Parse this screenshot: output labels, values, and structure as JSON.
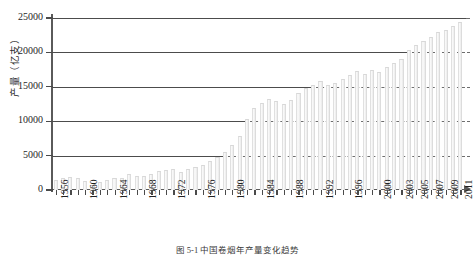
{
  "chart_data": {
    "type": "bar",
    "title": "",
    "xlabel": "",
    "ylabel": "产量（亿支）",
    "ylim": [
      0,
      25000
    ],
    "yticks": [
      0,
      5000,
      10000,
      15000,
      20000,
      25000
    ],
    "ytick_labels": [
      "0",
      "5000",
      "10000",
      "15000",
      "20000",
      "25000"
    ],
    "grid": true,
    "legend": "none",
    "categories": [
      "1956",
      "1957",
      "1958",
      "1959",
      "1960",
      "1961",
      "1962",
      "1963",
      "1964",
      "1965",
      "1966",
      "1967",
      "1968",
      "1969",
      "1970",
      "1971",
      "1972",
      "1973",
      "1974",
      "1975",
      "1976",
      "1977",
      "1978",
      "1979",
      "1980",
      "1981",
      "1982",
      "1983",
      "1984",
      "1985",
      "1986",
      "1987",
      "1988",
      "1989",
      "1990",
      "1991",
      "1992",
      "1993",
      "1994",
      "1995",
      "1996",
      "1997",
      "1998",
      "1999",
      "2000",
      "2001",
      "2002",
      "2003",
      "2004",
      "2005",
      "2006",
      "2007",
      "2008",
      "2009",
      "2010",
      "2011"
    ],
    "labeled_ticks": [
      "1956",
      "1960",
      "1964",
      "1968",
      "1972",
      "1976",
      "1980",
      "1984",
      "1988",
      "1992",
      "1996",
      "2000",
      "2003",
      "2005",
      "2007",
      "2009",
      "2011"
    ],
    "values": [
      1450,
      1800,
      1950,
      1700,
      1250,
      700,
      1100,
      1500,
      1750,
      1800,
      2350,
      2100,
      2050,
      2300,
      2700,
      2900,
      3100,
      2600,
      3000,
      3300,
      3700,
      4200,
      4800,
      5500,
      6500,
      7800,
      10300,
      11900,
      12700,
      13200,
      12900,
      12500,
      13100,
      14100,
      14800,
      15200,
      15800,
      15300,
      15500,
      16200,
      16700,
      17300,
      16900,
      17400,
      17200,
      17900,
      18500,
      19100,
      20400,
      21100,
      21700,
      22300,
      22900,
      23300,
      23900,
      24400
    ],
    "units": "亿支",
    "caption": "图 5-1 中国卷烟年产量变化趋势"
  },
  "axis": {
    "y_title": "产量（亿支）"
  }
}
